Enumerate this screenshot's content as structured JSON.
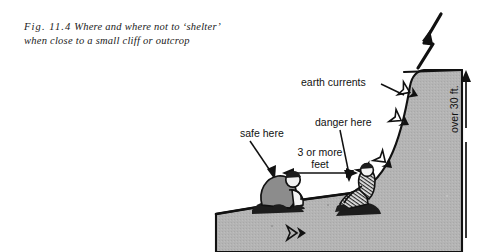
{
  "figure": {
    "caption_line1_fignum": "Fig. 11.4",
    "caption_line1_rest": "Where and where not to ‘shelter’",
    "caption_line2": "when close to a small cliff or outcrop"
  },
  "labels": {
    "earth_currents": "earth currents",
    "danger_here": "danger here",
    "safe_here": "safe here",
    "distance_line1": "3 or more",
    "distance_line2": "feet",
    "height": "over 30 ft."
  },
  "colors": {
    "ink": "#111111",
    "terrain_fill": "#b3b3b3",
    "terrain_stroke": "#111111",
    "figure_fill": "#8c8c8c",
    "page_background": "#ffffff"
  },
  "icons": {
    "lightning": "lightning-bolt-icon",
    "current_arrow": "earth-current-arrow-icon",
    "height_arrow": "height-dimension-arrow-icon",
    "distance_arrow": "distance-dimension-arrow-icon",
    "crouching_person": "crouching-person-icon",
    "seated_person": "seated-person-icon"
  }
}
